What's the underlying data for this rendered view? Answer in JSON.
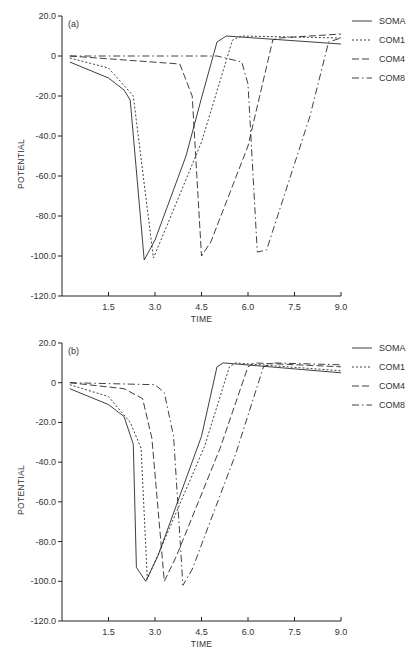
{
  "chart_data": [
    {
      "type": "line",
      "panel_label": "(a)",
      "xlabel": "TIME",
      "ylabel": "POTENTIAL",
      "xlim": [
        0,
        9.0
      ],
      "ylim": [
        -120.0,
        20.0
      ],
      "x_ticks": [
        "1.5",
        "3.0",
        "4.5",
        "6.0",
        "7.5",
        "9.0"
      ],
      "y_ticks": [
        "20.0",
        "0",
        "-20.0",
        "-40.0",
        "-60.0",
        "-80.0",
        "-100.0",
        "-120.0"
      ],
      "grid": false,
      "legend_position": "upper right, outside",
      "series": [
        {
          "name": "SOMA",
          "style": "solid",
          "x": [
            0.25,
            1.5,
            2.0,
            2.2,
            2.65,
            3.0,
            4.0,
            4.5,
            5.0,
            5.3,
            9.0
          ],
          "y": [
            -3,
            -11,
            -17,
            -22,
            -102,
            -92,
            -50,
            -21,
            7,
            10,
            6
          ]
        },
        {
          "name": "COM1",
          "style": "dotted",
          "x": [
            0.25,
            1.5,
            2.3,
            2.95,
            3.3,
            4.5,
            5.5,
            5.8,
            9.0
          ],
          "y": [
            -1,
            -6,
            -20,
            -101,
            -88,
            -43,
            8,
            10,
            9
          ]
        },
        {
          "name": "COM4",
          "style": "dashed",
          "x": [
            0.25,
            3.8,
            4.2,
            4.5,
            4.8,
            6.0,
            6.8,
            7.0,
            9.0
          ],
          "y": [
            0,
            -4,
            -20,
            -100,
            -93,
            -45,
            8,
            9,
            11
          ]
        },
        {
          "name": "COM8",
          "style": "dash-dot",
          "x": [
            0.25,
            5.0,
            5.8,
            6.0,
            6.3,
            6.6,
            8.0,
            8.6,
            9.0
          ],
          "y": [
            0,
            0,
            -3,
            -14,
            -98,
            -97,
            -30,
            7,
            9
          ]
        }
      ]
    },
    {
      "type": "line",
      "panel_label": "(b)",
      "xlabel": "TIME",
      "ylabel": "POTENTIAL",
      "xlim": [
        0,
        9.0
      ],
      "ylim": [
        -120.0,
        20.0
      ],
      "x_ticks": [
        "1.5",
        "3.0",
        "4.5",
        "6.0",
        "7.5",
        "9.0"
      ],
      "y_ticks": [
        "20.0",
        "0",
        "-20.0",
        "-40.0",
        "-60.0",
        "-80.0",
        "-100.0",
        "-120.0"
      ],
      "grid": false,
      "legend_position": "upper right, outside",
      "series": [
        {
          "name": "SOMA",
          "style": "solid",
          "x": [
            0.25,
            1.5,
            2.0,
            2.3,
            2.4,
            2.7,
            3.1,
            4.5,
            5.0,
            5.2,
            9.0
          ],
          "y": [
            -3,
            -11,
            -17,
            -31,
            -93,
            -100,
            -87,
            -27,
            8,
            10,
            5
          ]
        },
        {
          "name": "COM1",
          "style": "dotted",
          "x": [
            0.25,
            1.5,
            2.2,
            2.55,
            2.75,
            3.2,
            4.6,
            5.4,
            5.6,
            9.0
          ],
          "y": [
            -1,
            -7,
            -20,
            -33,
            -99,
            -83,
            -32,
            8,
            10,
            6
          ]
        },
        {
          "name": "COM4",
          "style": "dashed",
          "x": [
            0.25,
            2.0,
            2.6,
            2.9,
            3.3,
            3.7,
            5.1,
            6.0,
            6.2,
            9.0
          ],
          "y": [
            0,
            -3,
            -8,
            -28,
            -100,
            -87,
            -33,
            8,
            10,
            8
          ]
        },
        {
          "name": "COM8",
          "style": "dash-dot",
          "x": [
            0.25,
            3.0,
            3.3,
            3.6,
            3.9,
            4.2,
            5.6,
            6.5,
            6.8,
            9.0
          ],
          "y": [
            0,
            -1,
            -5,
            -27,
            -102,
            -94,
            -36,
            8,
            10,
            9
          ]
        }
      ]
    }
  ],
  "layout": {
    "panels": [
      {
        "x0": 62,
        "x1": 341,
        "y_top": 16,
        "y_bottom": 296
      },
      {
        "x0": 62,
        "x1": 341,
        "y_top": 343,
        "y_bottom": 621
      }
    ]
  }
}
